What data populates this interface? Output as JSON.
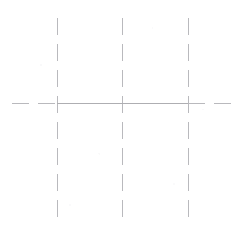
{
  "document": {
    "kind": "technical-drawing",
    "title": "Centerline Layout",
    "background_color": "#ffffff"
  },
  "canvas": {
    "width": 242,
    "height": 233
  },
  "style": {
    "line_color": "#b9b9bd",
    "solid_line_color": "#aeaeb2",
    "line_width": 1,
    "dash_length": 17,
    "gap_length": 9
  },
  "chart_data": {
    "type": "line",
    "xlabel": "",
    "ylabel": "",
    "xlim": [
      0,
      242
    ],
    "ylim": [
      0,
      233
    ],
    "grid": false,
    "legend": "none",
    "annotations": [],
    "series": [
      {
        "name": "vertical-centerline-left",
        "orientation": "vertical",
        "style": "dashed",
        "x": 57,
        "y_start": 18,
        "y_end": 222,
        "color": "#b9b9bd"
      },
      {
        "name": "vertical-centerline-middle",
        "orientation": "vertical",
        "style": "dashed",
        "x": 122,
        "y_start": 18,
        "y_end": 222,
        "color": "#b9b9bd"
      },
      {
        "name": "vertical-centerline-right",
        "orientation": "vertical",
        "style": "dashed",
        "x": 188,
        "y_start": 18,
        "y_end": 222,
        "color": "#b9b9bd"
      },
      {
        "name": "horizontal-centerline-solid",
        "orientation": "horizontal",
        "style": "solid",
        "y": 103,
        "x_start": 57,
        "x_end": 188,
        "color": "#aeaeb2"
      },
      {
        "name": "horizontal-centerline-left-extension",
        "orientation": "horizontal",
        "style": "dashed",
        "y": 103,
        "x_start": 12,
        "x_end": 57,
        "color": "#b9b9bd"
      },
      {
        "name": "horizontal-centerline-right-extension",
        "orientation": "horizontal",
        "style": "dashed",
        "y": 103,
        "x_start": 188,
        "x_end": 233,
        "color": "#b9b9bd"
      }
    ],
    "intersections": [
      {
        "name": "left-intersection",
        "x": 57,
        "y": 103
      },
      {
        "name": "center-intersection",
        "x": 122,
        "y": 103
      },
      {
        "name": "right-intersection",
        "x": 188,
        "y": 103
      }
    ]
  }
}
